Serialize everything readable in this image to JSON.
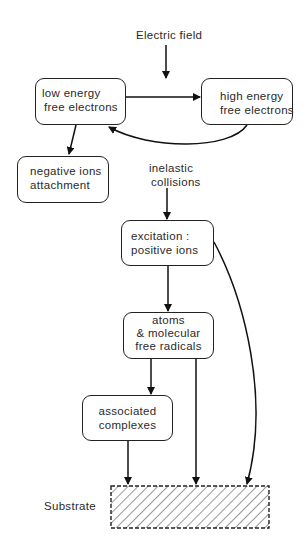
{
  "diagram": {
    "top_label": "Electric field",
    "nodes": {
      "low_energy": {
        "line1": "low energy",
        "line2": "free electrons"
      },
      "high_energy": {
        "line1": "high energy",
        "line2": "free electrons"
      },
      "negative_ions": {
        "line1": "negative ions",
        "line2": "attachment"
      },
      "excitation": {
        "line1": "excitation :",
        "line2": "positive ions"
      },
      "atoms": {
        "line1": "atoms",
        "line2": "& molecular",
        "line3": "free radicals"
      },
      "associated": {
        "line1": "associated",
        "line2": "complexes"
      }
    },
    "edge_label_inelastic": {
      "line1": "inelastic",
      "line2": "collisions"
    },
    "substrate_label": "Substrate",
    "edges": [
      "Electric field -> low/high energy link",
      "low energy free electrons -> high energy free electrons",
      "high energy free electrons -> low energy free electrons",
      "low energy free electrons -> negative ions attachment",
      "inelastic collisions -> excitation : positive ions",
      "excitation : positive ions -> atoms & molecular free radicals",
      "excitation : positive ions -> Substrate",
      "atoms & molecular free radicals -> associated complexes",
      "atoms & molecular free radicals -> Substrate",
      "associated complexes -> Substrate"
    ]
  }
}
